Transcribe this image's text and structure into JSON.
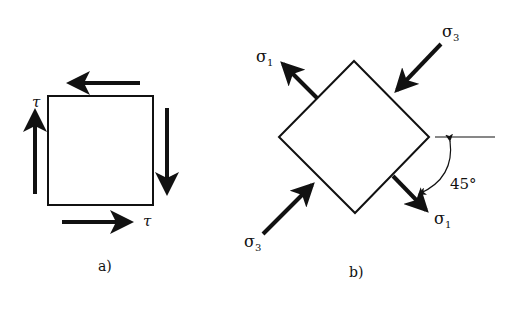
{
  "figure_a": {
    "caption": "a)",
    "label_top_left": "τ",
    "label_bottom_right": "τ"
  },
  "figure_b": {
    "caption": "b)",
    "sigma1_top": "σ",
    "sigma1_top_sub": "1",
    "sigma3_top": "σ",
    "sigma3_top_sub": "3",
    "sigma3_bottom": "σ",
    "sigma3_bottom_sub": "3",
    "sigma1_bottom": "σ",
    "sigma1_bottom_sub": "1",
    "angle_label": "45°"
  }
}
